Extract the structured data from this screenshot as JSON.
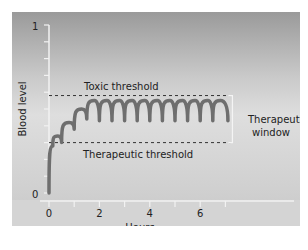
{
  "chart_data": {
    "type": "line",
    "title": "",
    "xlabel": "Hours",
    "ylabel": "Blood level",
    "xlim": [
      0,
      7.5
    ],
    "ylim": [
      0,
      1
    ],
    "x_ticks": [
      0,
      1,
      2,
      3,
      4,
      5,
      6,
      7
    ],
    "x_tick_labels": [
      "0",
      "2",
      "4",
      "6"
    ],
    "x_tick_label_values": [
      0,
      2,
      4,
      6
    ],
    "y_ticks": [
      0,
      0.1,
      0.2,
      0.3,
      0.4,
      0.5,
      0.6,
      0.7,
      0.8,
      0.9,
      1
    ],
    "y_tick_labels": [
      "0",
      "1"
    ],
    "grid": false,
    "legend": null,
    "series": [
      {
        "name": "Blood level",
        "color": "#6e6e6e",
        "description": "Repeated dosing: rises from 0 with scalloped peaks, then oscillates within the therapeutic window",
        "x": [
          0.0,
          0.15,
          0.35,
          0.5,
          0.8,
          1.0,
          1.3,
          1.5,
          1.8,
          2.0,
          2.3,
          2.5,
          2.8,
          3.0,
          3.3,
          3.5,
          3.8,
          4.0,
          4.3,
          4.5,
          4.8,
          5.0,
          5.3,
          5.5,
          5.8,
          6.0,
          6.3,
          6.5,
          6.8,
          7.1
        ],
        "y": [
          0.0,
          0.28,
          0.34,
          0.3,
          0.42,
          0.38,
          0.5,
          0.44,
          0.55,
          0.43,
          0.55,
          0.43,
          0.55,
          0.43,
          0.55,
          0.43,
          0.55,
          0.43,
          0.55,
          0.43,
          0.55,
          0.43,
          0.55,
          0.43,
          0.55,
          0.43,
          0.55,
          0.43,
          0.55,
          0.43
        ]
      }
    ],
    "reference_lines": [
      {
        "name": "Toxic threshold",
        "y": 0.58,
        "style": "dashed",
        "x_range": [
          0,
          7.2
        ]
      },
      {
        "name": "Therapeutic threshold",
        "y": 0.3,
        "style": "dashed",
        "x_range": [
          0,
          7.2
        ]
      }
    ],
    "annotations": [
      {
        "text": "Toxic threshold",
        "x": 1.1,
        "y": 0.63
      },
      {
        "text": "Therapeutic threshold",
        "x": 1.1,
        "y": 0.24
      },
      {
        "text": "Therapeutic window",
        "bracket_between": [
          0.3,
          0.58
        ]
      }
    ]
  },
  "labels": {
    "y_axis_title": "Blood level",
    "x_axis_title": "Hours",
    "y_top": "1",
    "y_bottom": "0",
    "x0": "0",
    "x2": "2",
    "x4": "4",
    "x6": "6",
    "toxic": "Toxic threshold",
    "therapeutic": "Therapeutic threshold",
    "window_line1": "Therapeutic",
    "window_line2": "window"
  }
}
